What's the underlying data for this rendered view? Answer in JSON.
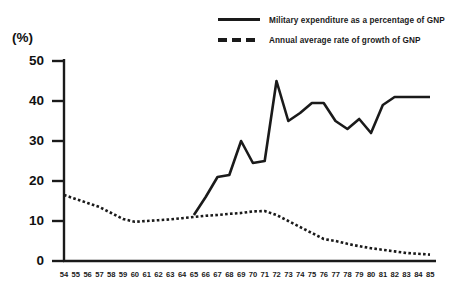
{
  "unit_label": "(%)",
  "legend": [
    {
      "style": "solid",
      "label": "Military expenditure as a percentage of GNP"
    },
    {
      "style": "dashed",
      "label": "Annual average rate of growth of GNP"
    }
  ],
  "chart_data": {
    "type": "line",
    "title": "",
    "xlabel": "",
    "ylabel": "(%)",
    "ylim": [
      0,
      50
    ],
    "yticks": [
      0,
      10,
      20,
      30,
      40,
      50
    ],
    "grid": false,
    "legend_position": "top-right",
    "categories": [
      "54",
      "55",
      "56",
      "57",
      "58",
      "59",
      "60",
      "61",
      "62",
      "63",
      "64",
      "65",
      "66",
      "67",
      "68",
      "69",
      "70",
      "71",
      "72",
      "73",
      "74",
      "75",
      "76",
      "77",
      "78",
      "79",
      "80",
      "81",
      "82",
      "83",
      "84",
      "85"
    ],
    "series": [
      {
        "name": "Military expenditure as a percentage of GNP",
        "style": "solid",
        "values": [
          null,
          null,
          null,
          null,
          null,
          null,
          null,
          null,
          null,
          null,
          null,
          11.5,
          16,
          21,
          21.5,
          30,
          24.5,
          25,
          45,
          35,
          37,
          39.5,
          39.5,
          35,
          33,
          35.5,
          32,
          39,
          41,
          41,
          41,
          41
        ]
      },
      {
        "name": "Annual average rate of growth of GNP",
        "style": "dashed",
        "values": [
          16.5,
          15.5,
          14.5,
          13.5,
          12,
          10.5,
          9.8,
          10,
          10.2,
          10.4,
          10.7,
          11,
          11.3,
          11.5,
          11.8,
          12,
          12.4,
          12.5,
          11.5,
          10,
          8.5,
          7,
          5.5,
          5,
          4.3,
          3.7,
          3.2,
          2.8,
          2.4,
          2,
          1.8,
          1.6
        ]
      }
    ]
  }
}
